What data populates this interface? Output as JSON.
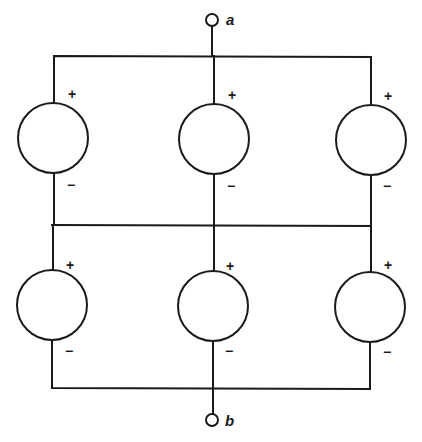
{
  "diagram": {
    "type": "circuit",
    "terminals": [
      {
        "id": "a",
        "label": "a",
        "x": 212,
        "y": 20
      },
      {
        "id": "b",
        "label": "b",
        "x": 212,
        "y": 420
      }
    ],
    "sources": [
      {
        "id": "s1",
        "row": 1,
        "col": 1,
        "cx": 53,
        "cy": 138,
        "plus": "+",
        "minus": "−"
      },
      {
        "id": "s2",
        "row": 1,
        "col": 2,
        "cx": 214,
        "cy": 139,
        "plus": "+",
        "minus": "−"
      },
      {
        "id": "s3",
        "row": 1,
        "col": 3,
        "cx": 371,
        "cy": 140,
        "plus": "+",
        "minus": "−"
      },
      {
        "id": "s4",
        "row": 2,
        "col": 1,
        "cx": 52,
        "cy": 305,
        "plus": "+",
        "minus": "−"
      },
      {
        "id": "s5",
        "row": 2,
        "col": 2,
        "cx": 213,
        "cy": 306,
        "plus": "+",
        "minus": "−"
      },
      {
        "id": "s6",
        "row": 2,
        "col": 3,
        "cx": 370,
        "cy": 307,
        "plus": "+",
        "minus": "−"
      }
    ],
    "colors": {
      "stroke": "#1a1a1a",
      "background": "#ffffff"
    }
  }
}
